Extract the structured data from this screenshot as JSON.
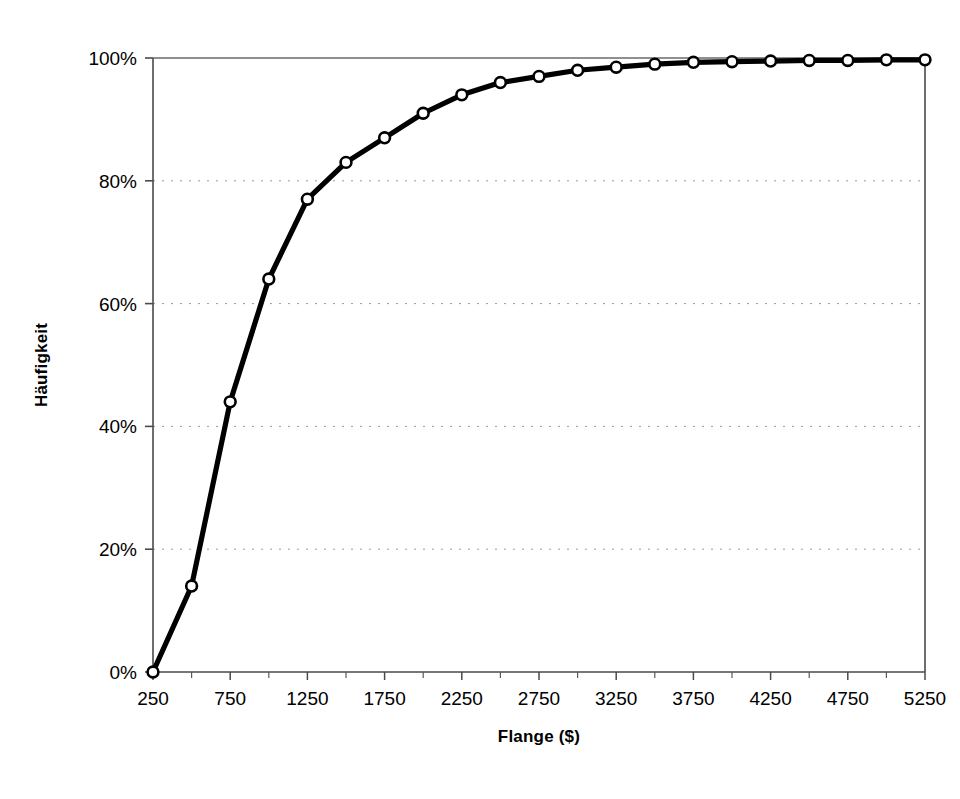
{
  "chart_data": {
    "type": "line",
    "title": "",
    "subtitle": "",
    "xlabel": "Flange ($)",
    "ylabel": "Häufigkeit",
    "xlim": [
      250,
      5250
    ],
    "ylim": [
      0,
      100
    ],
    "grid": "horizontal-dotted",
    "legend": "none",
    "marker": "open-circle",
    "line_color": "#000000",
    "marker_fill": "#ffffff",
    "x_tick_labels": [
      "250",
      "750",
      "1250",
      "1750",
      "2250",
      "2750",
      "3250",
      "3750",
      "4250",
      "4750",
      "5250"
    ],
    "x_tick_values": [
      250,
      750,
      1250,
      1750,
      2250,
      2750,
      3250,
      3750,
      4250,
      4750,
      5250
    ],
    "x_minor_tick_values": [
      500,
      1000,
      1500,
      2000,
      2500,
      3000,
      3500,
      4000,
      4500,
      5000
    ],
    "y_tick_labels": [
      "0%",
      "20%",
      "40%",
      "60%",
      "80%",
      "100%"
    ],
    "y_tick_values": [
      0,
      20,
      40,
      60,
      80,
      100
    ],
    "series": [
      {
        "name": "Kumulierte Häufigkeit",
        "x": [
          250,
          500,
          750,
          1000,
          1250,
          1500,
          1750,
          2000,
          2250,
          2500,
          2750,
          3000,
          3250,
          3500,
          3750,
          4000,
          4250,
          4500,
          4750,
          5000,
          5250
        ],
        "values": [
          0,
          14,
          44,
          64,
          77,
          83,
          87,
          91,
          94,
          96,
          97,
          98,
          98.5,
          99,
          99.3,
          99.4,
          99.5,
          99.6,
          99.6,
          99.7,
          99.7
        ]
      }
    ]
  },
  "axes": {
    "x_title": "Flange ($)",
    "y_title": "Häufigkeit"
  }
}
